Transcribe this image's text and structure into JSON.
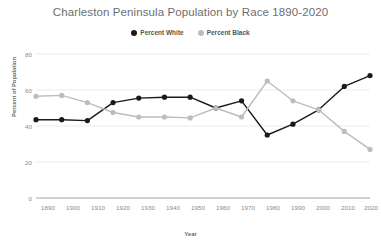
{
  "chart_data": {
    "type": "line",
    "title": "Charleston Peninsula Population by Race 1890-2020",
    "xlabel": "Year",
    "ylabel": "Percent of Population",
    "categories": [
      "1890",
      "1900",
      "1910",
      "1920",
      "1930",
      "1940",
      "1950",
      "1960",
      "1970",
      "1980",
      "1990",
      "2000",
      "2010",
      "2020"
    ],
    "x": [
      1890,
      1900,
      1910,
      1920,
      1930,
      1940,
      1950,
      1960,
      1970,
      1980,
      1990,
      2000,
      2010,
      2020
    ],
    "xlim": [
      1890,
      2020
    ],
    "ylim": [
      0,
      80
    ],
    "yticks": [
      0,
      20,
      40,
      60,
      80
    ],
    "grid": true,
    "legend_position": "top-center",
    "series": [
      {
        "name": "Percent White",
        "color": "#1a1a1a",
        "values": [
          43.5,
          43.5,
          43.0,
          53.0,
          55.5,
          56.0,
          56.0,
          50.0,
          54.0,
          35.0,
          41.0,
          49.0,
          62.0,
          68.0
        ]
      },
      {
        "name": "Percent Black",
        "color": "#bdbdbd",
        "values": [
          56.5,
          57.0,
          53.0,
          47.5,
          45.0,
          45.0,
          44.5,
          50.0,
          45.0,
          65.0,
          54.0,
          49.0,
          37.0,
          27.0
        ]
      }
    ]
  },
  "axis": {
    "ytick_labels": [
      "0",
      "20",
      "40",
      "60",
      "80"
    ]
  }
}
